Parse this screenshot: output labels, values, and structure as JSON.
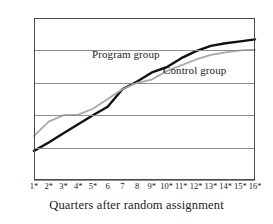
{
  "chart_data": {
    "type": "line",
    "title": "",
    "xlabel": "Quarters after random assignment",
    "ylabel": "",
    "ylim": [
      0,
      250
    ],
    "xlim": [
      1,
      16
    ],
    "yticks": [
      0,
      50,
      100,
      150,
      200,
      250
    ],
    "grid": true,
    "legend_position": "inline-annotation",
    "categories": [
      "1*",
      "2*",
      "3*",
      "4*",
      "5*",
      "6",
      "7",
      "8",
      "9*",
      "10*",
      "11*",
      "12*",
      "13*",
      "14*",
      "15*",
      "16*"
    ],
    "x": [
      1,
      2,
      3,
      4,
      5,
      6,
      7,
      8,
      9,
      10,
      11,
      12,
      13,
      14,
      15,
      16
    ],
    "series": [
      {
        "name": "Program group",
        "color": "#111111",
        "values": [
          45,
          58,
          72,
          86,
          100,
          113,
          140,
          152,
          166,
          174,
          188,
          199,
          207,
          211,
          214,
          217
        ]
      },
      {
        "name": "Control group",
        "color": "#a8a8a8",
        "values": [
          68,
          90,
          100,
          101,
          110,
          125,
          140,
          150,
          155,
          168,
          177,
          186,
          193,
          197,
          200,
          201
        ]
      }
    ]
  },
  "axis": {
    "y_tick_labels": [
      "250",
      "200",
      "150",
      "100",
      "50",
      "0"
    ],
    "x_title": "Quarters after random assignment"
  },
  "annotations": {
    "program_label": "Program group",
    "control_label": "Control group"
  }
}
